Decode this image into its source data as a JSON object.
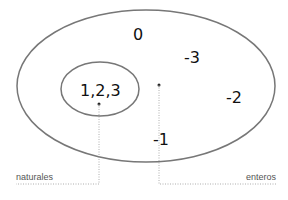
{
  "diagram": {
    "type": "venn",
    "outer_set": {
      "label": "enteros",
      "elements": [
        "0",
        "-3",
        "-2",
        "-1"
      ]
    },
    "inner_set": {
      "label": "naturales",
      "elements_text": "1,2,3"
    },
    "colors": {
      "outline": "#777777",
      "text": "#111111",
      "label": "#555555",
      "leader": "#999999"
    }
  }
}
